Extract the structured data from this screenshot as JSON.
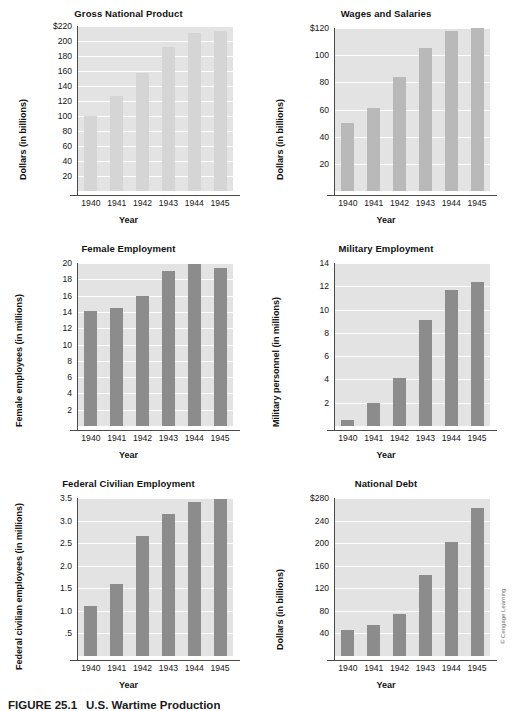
{
  "figure": {
    "number": "FIGURE 25.1",
    "caption": "U.S. Wartime Production",
    "credit": "© Cengage Learning"
  },
  "common": {
    "xlabel": "Year",
    "categories": [
      "1940",
      "1941",
      "1942",
      "1943",
      "1944",
      "1945"
    ]
  },
  "colors": {
    "plot_background": "#e3e3e3",
    "gridline": "#ffffff",
    "bar_light": "#d5d5d5",
    "bar_medium": "#b9b9b9",
    "bar_dark": "#8c8c8c",
    "axis": "#4a4a4a",
    "text": "#161616"
  },
  "chart_data": [
    {
      "type": "bar",
      "title": "Gross National Product",
      "xlabel": "Year",
      "ylabel": "Dollars (in billions)",
      "categories": [
        "1940",
        "1941",
        "1942",
        "1943",
        "1944",
        "1945"
      ],
      "values": [
        100,
        127,
        158,
        192,
        211,
        213
      ],
      "yticks": [
        20,
        40,
        60,
        80,
        100,
        120,
        140,
        160,
        180,
        200,
        220
      ],
      "ytick_labels": [
        "20",
        "40",
        "60",
        "80",
        "100",
        "120",
        "140",
        "160",
        "180",
        "200",
        "$220"
      ],
      "ylim": [
        0,
        220
      ],
      "grid": true,
      "bar_color": "#d5d5d5",
      "legend": "none"
    },
    {
      "type": "bar",
      "title": "Wages and Salaries",
      "xlabel": "Year",
      "ylabel": "Dollars (in billions)",
      "categories": [
        "1940",
        "1941",
        "1942",
        "1943",
        "1944",
        "1945"
      ],
      "values": [
        50,
        61,
        84,
        105,
        118,
        120
      ],
      "yticks": [
        20,
        40,
        60,
        80,
        100,
        120
      ],
      "ytick_labels": [
        "20",
        "40",
        "60",
        "80",
        "100",
        "$120"
      ],
      "ylim": [
        0,
        120
      ],
      "grid": true,
      "bar_color": "#b9b9b9",
      "legend": "none"
    },
    {
      "type": "bar",
      "title": "Female Employment",
      "xlabel": "Year",
      "ylabel": "Female employees (in millions)",
      "categories": [
        "1940",
        "1941",
        "1942",
        "1943",
        "1944",
        "1945"
      ],
      "values": [
        14.1,
        14.5,
        16.0,
        19.0,
        19.9,
        19.4
      ],
      "yticks": [
        2,
        4,
        6,
        8,
        10,
        12,
        14,
        16,
        18,
        20
      ],
      "ytick_labels": [
        "2",
        "4",
        "6",
        "8",
        "10",
        "12",
        "14",
        "16",
        "18",
        "20"
      ],
      "ylim": [
        0,
        20
      ],
      "grid": true,
      "bar_color": "#8c8c8c",
      "legend": "none"
    },
    {
      "type": "bar",
      "title": "Military Employment",
      "xlabel": "Year",
      "ylabel": "Military personnel (in millions)",
      "categories": [
        "1940",
        "1941",
        "1942",
        "1943",
        "1944",
        "1945"
      ],
      "values": [
        0.5,
        2.0,
        4.1,
        9.1,
        11.7,
        12.4
      ],
      "yticks": [
        2,
        4,
        6,
        8,
        10,
        12,
        14
      ],
      "ytick_labels": [
        "2",
        "4",
        "6",
        "8",
        "10",
        "12",
        "14"
      ],
      "ylim": [
        0,
        14
      ],
      "grid": true,
      "bar_color": "#8c8c8c",
      "legend": "none"
    },
    {
      "type": "bar",
      "title": "Federal Civilian Employment",
      "xlabel": "Year",
      "ylabel": "Federal civilian employees (in millions)",
      "categories": [
        "1940",
        "1941",
        "1942",
        "1943",
        "1944",
        "1945"
      ],
      "values": [
        1.1,
        1.6,
        2.65,
        3.15,
        3.42,
        3.47
      ],
      "yticks": [
        0.5,
        1.0,
        1.5,
        2.0,
        2.5,
        3.0,
        3.5
      ],
      "ytick_labels": [
        ".5",
        "1.0",
        "1.5",
        "2.0",
        "2.5",
        "3.0",
        "3.5"
      ],
      "ylim": [
        0,
        3.5
      ],
      "grid": true,
      "bar_color": "#8c8c8c",
      "legend": "none"
    },
    {
      "type": "bar",
      "title": "National Debt",
      "xlabel": "Year",
      "ylabel": "Dollars (in billions)",
      "categories": [
        "1940",
        "1941",
        "1942",
        "1943",
        "1944",
        "1945"
      ],
      "values": [
        46,
        55,
        75,
        144,
        202,
        262
      ],
      "yticks": [
        40,
        80,
        120,
        160,
        200,
        240,
        280
      ],
      "ytick_labels": [
        "40",
        "80",
        "120",
        "160",
        "200",
        "240",
        "$280"
      ],
      "ylim": [
        0,
        280
      ],
      "grid": true,
      "bar_color": "#8c8c8c",
      "legend": "none"
    }
  ]
}
